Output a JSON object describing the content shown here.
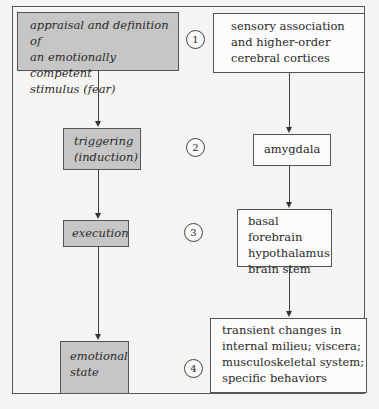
{
  "diagram": {
    "left_column": [
      {
        "id": "appraisal",
        "text": "appraisal and definition of\nan emotionally competent\nstimulus (fear)"
      },
      {
        "id": "triggering",
        "text": "triggering\n(induction)"
      },
      {
        "id": "execution",
        "text": "execution"
      },
      {
        "id": "emotional_state",
        "text": "emotional\nstate"
      }
    ],
    "steps": [
      "1",
      "2",
      "3",
      "4"
    ],
    "right_column": [
      {
        "id": "sensory",
        "text": "sensory association\nand higher-order\ncerebral cortices"
      },
      {
        "id": "amygdala",
        "text": "amygdala"
      },
      {
        "id": "basal",
        "text": "basal forebrain\nhypothalamus\nbrain stem"
      },
      {
        "id": "transient",
        "text": "transient changes in\ninternal milieu; viscera;\nmusculoskeletal system;\nspecific behaviors"
      }
    ],
    "colors": {
      "gray_box": "#c6c6c6",
      "white_box": "#fbfbfa",
      "border": "#555555"
    }
  }
}
